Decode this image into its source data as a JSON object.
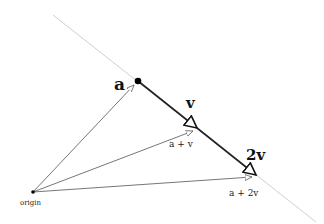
{
  "diagram": {
    "title": "",
    "colors": {
      "line_gray": "#c8c8c8",
      "vector_dark": "#222222",
      "thin_arrow": "#666666",
      "point_fill": "#000000",
      "background": "#ffffff"
    },
    "points": {
      "origin": {
        "x": 33,
        "y": 192
      },
      "a": {
        "x": 138,
        "y": 81
      },
      "a_plus_v": {
        "x": 197,
        "y": 128
      },
      "a_plus_2v": {
        "x": 256,
        "y": 175
      }
    },
    "line": {
      "x1": 53,
      "y1": 15,
      "x2": 316,
      "y2": 222
    },
    "labels": {
      "a": "a",
      "v": "v",
      "two_v": "2v",
      "a_plus_v": "a + v",
      "a_plus_2v": "a + 2v",
      "origin": "origin"
    }
  }
}
